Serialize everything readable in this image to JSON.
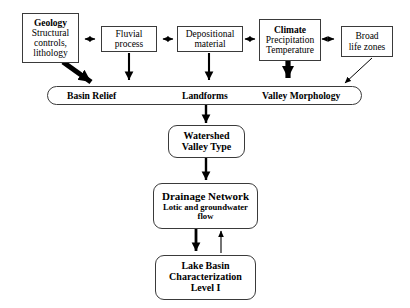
{
  "diagram": {
    "nodes": {
      "geology": {
        "heading": "Geology",
        "line1": "Structural",
        "line2": "controls,",
        "line3": "lithology"
      },
      "fluvial": {
        "line1": "Fluvial",
        "line2": "process"
      },
      "depositional": {
        "line1": "Depositional",
        "line2": "material"
      },
      "climate": {
        "heading": "Climate",
        "line1": "Precipitation",
        "line2": "Temperature"
      },
      "life_zones": {
        "line1": "Broad",
        "line2": "life zones"
      },
      "bar": {
        "label1": "Basin Relief",
        "label2": "Landforms",
        "label3": "Valley Morphology"
      },
      "watershed": {
        "line1": "Watershed",
        "line2": "Valley Type"
      },
      "drainage": {
        "heading": "Drainage Network",
        "line1": "Lotic and groundwater",
        "line2": "flow"
      },
      "lake_basin": {
        "line1": "Lake Basin",
        "line2": "Characterization",
        "line3": "Level I"
      }
    },
    "colors": {
      "stroke": "#3a3a3a",
      "arrow": "#000000",
      "background": "#ffffff",
      "text": "#000000"
    }
  }
}
